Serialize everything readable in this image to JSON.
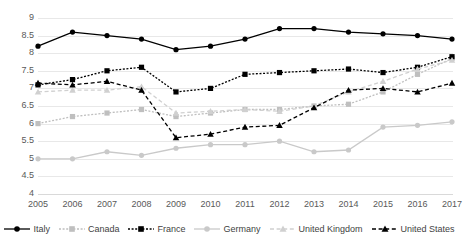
{
  "chart_data": {
    "type": "line",
    "title": "",
    "xlabel": "",
    "ylabel": "",
    "x": [
      2005,
      2006,
      2007,
      2008,
      2009,
      2010,
      2011,
      2012,
      2013,
      2014,
      2015,
      2016,
      2017
    ],
    "categories": [
      "2005",
      "2006",
      "2007",
      "2008",
      "2009",
      "2010",
      "2011",
      "2012",
      "2013",
      "2014",
      "2015",
      "2016",
      "2017"
    ],
    "ylim": [
      4,
      9
    ],
    "yticks": [
      "4",
      "4.5",
      "5",
      "5.5",
      "6",
      "6.5",
      "7",
      "7.5",
      "8",
      "8.5",
      "9"
    ],
    "grid": true,
    "legend_position": "bottom",
    "series": [
      {
        "name": "Italy",
        "color": "#000000",
        "marker": "circle",
        "dash": "solid",
        "values": [
          8.2,
          8.6,
          8.5,
          8.4,
          8.1,
          8.2,
          8.4,
          8.7,
          8.7,
          8.6,
          8.55,
          8.5,
          8.4
        ]
      },
      {
        "name": "Canada",
        "color": "#bfbfbf",
        "marker": "square",
        "dash": "dotted",
        "values": [
          6.0,
          6.2,
          6.3,
          6.4,
          6.2,
          6.3,
          6.4,
          6.4,
          6.5,
          6.55,
          6.9,
          7.4,
          7.85
        ]
      },
      {
        "name": "France",
        "color": "#000000",
        "marker": "square",
        "dash": "dotted",
        "values": [
          7.1,
          7.25,
          7.5,
          7.6,
          6.9,
          7.0,
          7.4,
          7.45,
          7.5,
          7.55,
          7.45,
          7.6,
          7.9
        ]
      },
      {
        "name": "Germany",
        "color": "#c9c9c9",
        "marker": "circle",
        "dash": "solid",
        "values": [
          5.0,
          5.0,
          5.2,
          5.1,
          5.3,
          5.4,
          5.4,
          5.5,
          5.2,
          5.25,
          5.9,
          5.95,
          6.05
        ]
      },
      {
        "name": "United Kingdom",
        "color": "#d0d0d0",
        "marker": "triangle",
        "dash": "dashed",
        "values": [
          6.9,
          6.95,
          6.95,
          7.05,
          6.3,
          6.35,
          6.4,
          6.35,
          6.5,
          6.9,
          7.2,
          7.55,
          7.8
        ]
      },
      {
        "name": "United States",
        "color": "#000000",
        "marker": "triangle",
        "dash": "dashed",
        "values": [
          7.15,
          7.1,
          7.2,
          6.95,
          5.6,
          5.7,
          5.9,
          5.95,
          6.45,
          6.95,
          7.0,
          6.9,
          7.15
        ]
      }
    ]
  },
  "legend": {
    "items": [
      {
        "label": "Italy"
      },
      {
        "label": "Canada"
      },
      {
        "label": "France"
      },
      {
        "label": "Germany"
      },
      {
        "label": "United Kingdom"
      },
      {
        "label": "United States"
      }
    ]
  }
}
